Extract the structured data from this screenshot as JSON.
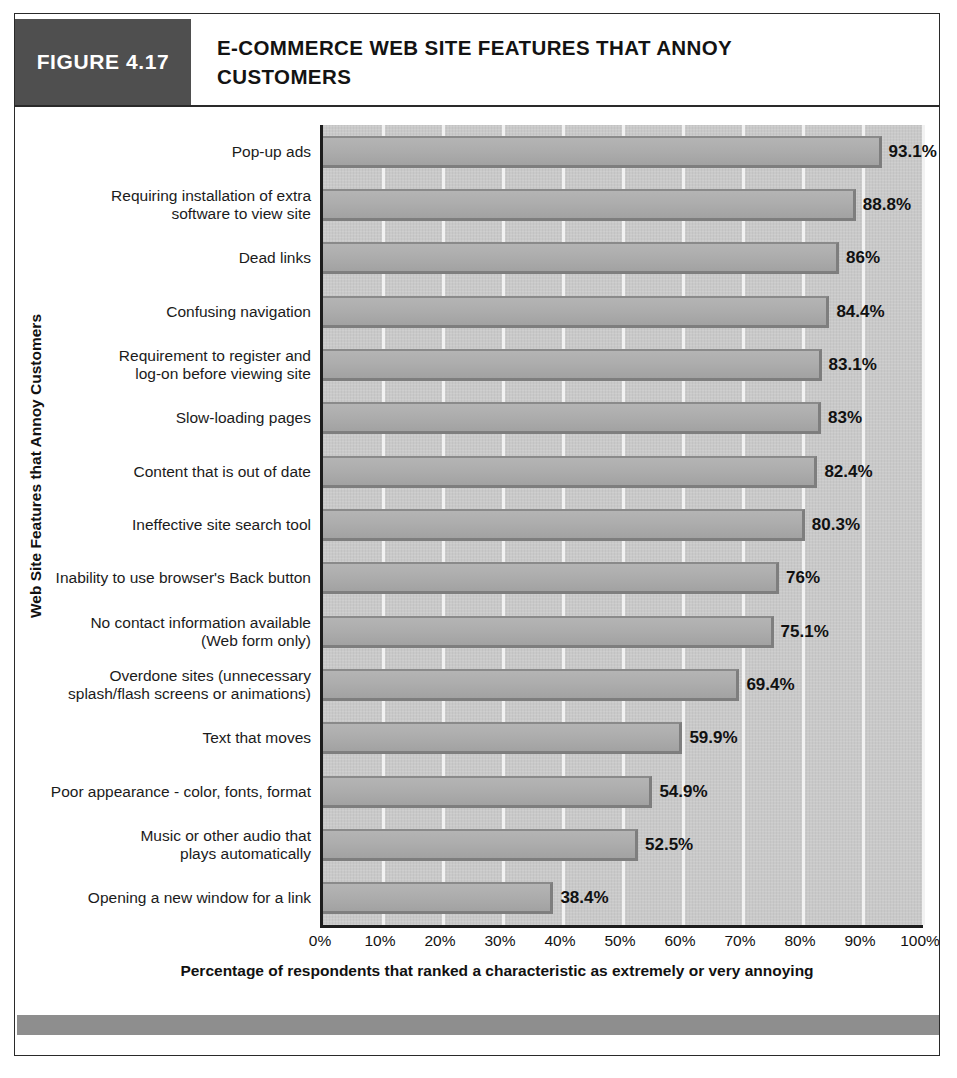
{
  "figure": {
    "number_label": "FIGURE 4.17",
    "title": "E-COMMERCE WEB SITE FEATURES THAT ANNOY CUSTOMERS"
  },
  "chart_data": {
    "type": "bar",
    "orientation": "horizontal",
    "title": "E-COMMERCE WEB SITE FEATURES THAT ANNOY CUSTOMERS",
    "xlabel": "Percentage of respondents that ranked a characteristic as extremely or very annoying",
    "ylabel": "Web Site Features that Annoy Customers",
    "xlim": [
      0,
      100
    ],
    "xticks": [
      "0%",
      "10%",
      "20%",
      "30%",
      "40%",
      "50%",
      "60%",
      "70%",
      "80%",
      "90%",
      "100%"
    ],
    "xtick_values": [
      0,
      10,
      20,
      30,
      40,
      50,
      60,
      70,
      80,
      90,
      100
    ],
    "grid": true,
    "legend": false,
    "categories": [
      "Pop-up ads",
      "Requiring installation of extra\nsoftware to view site",
      "Dead links",
      "Confusing navigation",
      "Requirement to register and\nlog-on before viewing site",
      "Slow-loading pages",
      "Content that is out of date",
      "Ineffective site search tool",
      "Inability to use browser's Back button",
      "No contact information available\n(Web form only)",
      "Overdone sites (unnecessary\nsplash/flash screens or animations)",
      "Text that moves",
      "Poor appearance - color, fonts, format",
      "Music or other audio that\nplays automatically",
      "Opening a new window for a link"
    ],
    "values": [
      93.1,
      88.8,
      86,
      84.4,
      83.1,
      83,
      82.4,
      80.3,
      76,
      75.1,
      69.4,
      59.9,
      54.9,
      52.5,
      38.4
    ],
    "value_labels": [
      "93.1%",
      "88.8%",
      "86%",
      "84.4%",
      "83.1%",
      "83%",
      "82.4%",
      "80.3%",
      "76%",
      "75.1%",
      "69.4%",
      "59.9%",
      "54.9%",
      "52.5%",
      "38.4%"
    ]
  },
  "colors": {
    "figure_number_bg": "#4f4f4f",
    "plot_bg": "#c9c9c9",
    "bar_fill": "#adadad",
    "bar_edge": "#7e7e7e",
    "gridline": "#f2f2f2",
    "footer_bar": "#8e8e8e",
    "text": "#111111"
  }
}
